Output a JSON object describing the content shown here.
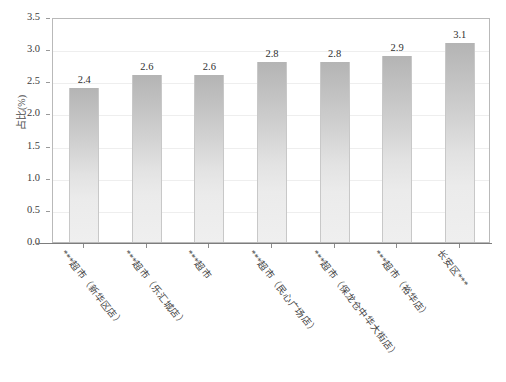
{
  "chart_data": {
    "type": "bar",
    "title": "",
    "xlabel": "",
    "ylabel": "占比(%)",
    "ylim": [
      0,
      3.5
    ],
    "ytick_step": 0.5,
    "grid": true,
    "legend": "none",
    "categories": [
      "***超市（新华区店）",
      "***超市（乐汇城店）",
      "***超市",
      "***超市（民心广场店）",
      "***超市（保龙仓中华大街店）",
      "***超市（裕华店）",
      "长安区***"
    ],
    "values": [
      2.4,
      2.6,
      2.6,
      2.8,
      2.8,
      2.9,
      3.1
    ],
    "value_labels": [
      "2.4",
      "2.6",
      "2.6",
      "2.8",
      "2.8",
      "2.9",
      "3.1"
    ],
    "ytick_labels": [
      "0.0",
      "0.5",
      "1.0",
      "1.5",
      "2.0",
      "2.5",
      "3.0",
      "3.5"
    ],
    "ytick_values": [
      0.0,
      0.5,
      1.0,
      1.5,
      2.0,
      2.5,
      3.0,
      3.5
    ],
    "bar_color_top": "#b4b4b4",
    "bar_color_bottom": "#efefef",
    "frame_color": "#b9b9b9",
    "grid_color": "#eeeeee",
    "axis_color": "#7d7d7d"
  },
  "caption": ""
}
